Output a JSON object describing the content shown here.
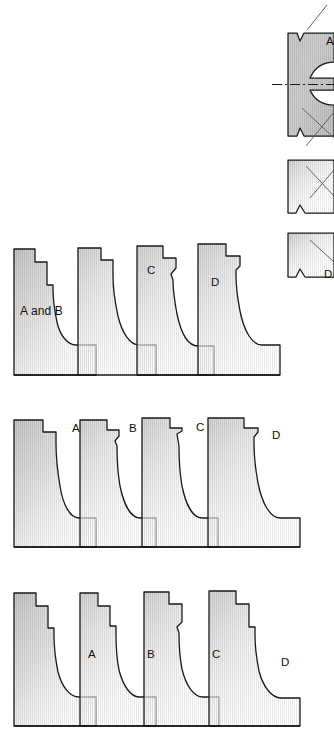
{
  "figure": {
    "background_color": "#ffffff",
    "outline_color": "#1a1a1a",
    "fill_light": "#ffffff",
    "fill_mid": "#d8d8d8",
    "fill_dark": "#a8a8a8",
    "hatch_color": "#bdbdbd"
  },
  "detail_drawing": {
    "name": "cam-lobe-section-detail",
    "description": "Partially cropped sectional detail at upper right with dash-dot centerline and leader lines",
    "centerline_style": "dash-dot",
    "labels": [
      {
        "id": "detail-label-a",
        "text": "A",
        "x": 326,
        "y": 43
      },
      {
        "id": "detail-label-d",
        "text": "D",
        "x": 324,
        "y": 276
      }
    ]
  },
  "rows": [
    {
      "id": "row-1",
      "name": "profile-row-upper",
      "shapes": [
        {
          "id": "r1s1",
          "name": "profile-shape-a-and-b",
          "label": "A and B",
          "label_x": 20,
          "label_y": 312,
          "label_size": "big"
        },
        {
          "id": "r1s2",
          "name": "profile-shape-unlabeled-2",
          "label": "",
          "label_x": 0,
          "label_y": 0
        },
        {
          "id": "r1s3",
          "name": "profile-shape-c",
          "label": "C",
          "label_x": 147,
          "label_y": 271
        },
        {
          "id": "r1s4",
          "name": "profile-shape-d",
          "label": "D",
          "label_x": 211,
          "label_y": 283
        }
      ]
    },
    {
      "id": "row-2",
      "name": "profile-row-middle",
      "shapes": [
        {
          "id": "r2s1",
          "name": "profile-shape-a",
          "label": "A",
          "label_x": 72,
          "label_y": 429
        },
        {
          "id": "r2s2",
          "name": "profile-shape-b",
          "label": "B",
          "label_x": 129,
          "label_y": 429
        },
        {
          "id": "r2s3",
          "name": "profile-shape-c",
          "label": "C",
          "label_x": 196,
          "label_y": 428
        },
        {
          "id": "r2s4",
          "name": "profile-shape-d",
          "label": "D",
          "label_x": 272,
          "label_y": 436
        }
      ]
    },
    {
      "id": "row-3",
      "name": "profile-row-lower",
      "shapes": [
        {
          "id": "r3s1",
          "name": "profile-shape-a",
          "label": "A",
          "label_x": 88,
          "label_y": 655
        },
        {
          "id": "r3s2",
          "name": "profile-shape-b",
          "label": "B",
          "label_x": 147,
          "label_y": 655
        },
        {
          "id": "r3s3",
          "name": "profile-shape-c",
          "label": "C",
          "label_x": 212,
          "label_y": 655
        },
        {
          "id": "r3s4",
          "name": "profile-shape-d",
          "label": "D",
          "label_x": 281,
          "label_y": 663
        }
      ]
    }
  ]
}
